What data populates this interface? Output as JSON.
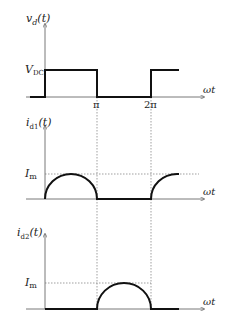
{
  "panels": [
    {
      "ylabel": "v",
      "ylabel_sub": "d",
      "ylabel_arg": "(t)",
      "level_label": "V",
      "level_sub": "DC",
      "xlabel": "ωt",
      "waveform": "square"
    },
    {
      "ylabel": "i",
      "ylabel_sub": "d1",
      "ylabel_arg": "(t)",
      "level_label": "I",
      "level_sub": "m",
      "xlabel": "ωt",
      "waveform": "half-sine positive half-cycles"
    },
    {
      "ylabel": "i",
      "ylabel_sub": "d2",
      "ylabel_arg": "(t)",
      "level_label": "I",
      "level_sub": "m",
      "xlabel": "ωt",
      "waveform": "half-sine negative half-cycles"
    }
  ],
  "ticks": {
    "pi": "π",
    "two_pi": "2π"
  },
  "colors": {
    "line": "#111111",
    "axis": "#555555",
    "dotted": "#777777"
  }
}
